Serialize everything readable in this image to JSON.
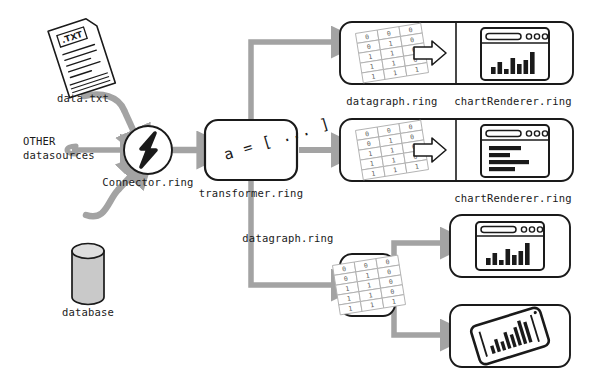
{
  "diagram": {
    "colors": {
      "arrow": "#a3a3a3",
      "arrow_dark": "#8f8f8f",
      "stroke": "#1a1a1a",
      "fill_white": "#ffffff",
      "cylinder_fill": "#c9c9c9",
      "grid_line": "#b0b0b0",
      "text": "#1a1a1a"
    },
    "sources": [
      {
        "id": "file",
        "label": "data.txt",
        "icon": "txt-file-icon",
        "badge": ".TXT"
      },
      {
        "id": "other",
        "label": "OTHER\ndatasources",
        "label_line1": "OTHER",
        "label_line2": "datasources",
        "icon": "other-sources-icon"
      },
      {
        "id": "db",
        "label": "database",
        "icon": "database-cylinder-icon"
      }
    ],
    "connector": {
      "label": "Connector.ring",
      "icon": "lightning-bolt-icon"
    },
    "transformer": {
      "label": "transformer.ring",
      "code": "a = [ ... ]"
    },
    "branches": [
      {
        "id": "branch-top",
        "datagraph_label": "datagraph.ring",
        "renderer_label": "chartRenderer.ring",
        "matrix": [
          [
            "0",
            "0",
            "0"
          ],
          [
            "0",
            "1",
            "0"
          ],
          [
            "1",
            "1",
            "0"
          ],
          [
            "1",
            "1",
            "0"
          ],
          [
            "1",
            "1",
            "1"
          ]
        ],
        "renderer_icon": "browser-bar-chart-icon",
        "bars": [
          30,
          48,
          22,
          62,
          40,
          55,
          86
        ],
        "inner_arrow": "block-arrow-right-icon"
      },
      {
        "id": "branch-middle",
        "datagraph_label": "",
        "renderer_label": "chartRenderer.ring",
        "matrix": [
          [
            "0",
            "0",
            "0"
          ],
          [
            "0",
            "1",
            "0"
          ],
          [
            "1",
            "1",
            "0"
          ],
          [
            "1",
            "1",
            "0"
          ],
          [
            "1",
            "1",
            "1"
          ]
        ],
        "renderer_icon": "browser-text-lines-icon",
        "lines": [
          62,
          40,
          78,
          50,
          92
        ],
        "inner_arrow": "block-arrow-right-icon"
      },
      {
        "id": "branch-bottom",
        "datagraph_label": "datagraph.ring",
        "matrix": [
          [
            "0",
            "0",
            "0"
          ],
          [
            "0",
            "1",
            "0"
          ],
          [
            "1",
            "1",
            "0"
          ],
          [
            "1",
            "1",
            "0"
          ],
          [
            "1",
            "1",
            "1"
          ]
        ],
        "outputs": [
          {
            "id": "out-desktop",
            "icon": "browser-bar-chart-icon",
            "bars": [
              30,
              48,
              22,
              62,
              40,
              55,
              86
            ]
          },
          {
            "id": "out-mobile",
            "icon": "phone-bar-chart-icon",
            "bars": [
              20,
              34,
              26,
              46,
              38,
              58,
              72
            ]
          }
        ]
      }
    ]
  }
}
